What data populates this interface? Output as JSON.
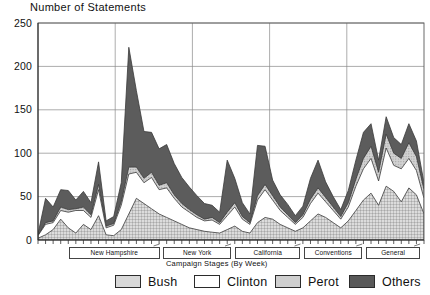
{
  "chart_data": {
    "type": "area",
    "stacked": true,
    "title": "Number of Statements",
    "xlabel": "Campaign Stages (By Week)",
    "ylabel": "",
    "ylim": [
      0,
      250
    ],
    "yticks": [
      0,
      50,
      100,
      150,
      200,
      250
    ],
    "ytick_labels": [
      "0",
      "50",
      "100",
      "150",
      "200",
      "250"
    ],
    "grid": true,
    "legend_position": "bottom",
    "x": [
      1,
      2,
      3,
      4,
      5,
      6,
      7,
      8,
      9,
      10,
      11,
      12,
      13,
      14,
      15,
      16,
      17,
      18,
      19,
      20,
      21,
      22,
      23,
      24,
      25,
      26,
      27,
      28,
      29,
      30,
      31,
      32,
      33,
      34,
      35,
      36,
      37,
      38,
      39,
      40,
      41,
      42,
      43,
      44,
      45,
      46,
      47,
      48,
      49,
      50,
      51,
      52
    ],
    "x_unit": "week",
    "series": [
      {
        "name": "Bush",
        "color": "#d8d8d8",
        "pattern": "crosshatch",
        "values": [
          2,
          6,
          12,
          24,
          14,
          8,
          18,
          12,
          28,
          6,
          5,
          12,
          30,
          48,
          42,
          36,
          30,
          26,
          22,
          18,
          14,
          12,
          10,
          9,
          8,
          12,
          16,
          10,
          8,
          20,
          26,
          24,
          18,
          14,
          10,
          14,
          22,
          30,
          26,
          20,
          14,
          22,
          34,
          46,
          54,
          40,
          62,
          56,
          44,
          60,
          52,
          30
        ]
      },
      {
        "name": "Clinton",
        "color": "#ffffff",
        "pattern": "solid-white",
        "values": [
          3,
          12,
          8,
          10,
          18,
          26,
          16,
          14,
          30,
          8,
          12,
          28,
          46,
          30,
          24,
          36,
          28,
          34,
          26,
          20,
          18,
          14,
          12,
          14,
          10,
          16,
          22,
          14,
          10,
          26,
          32,
          22,
          16,
          12,
          8,
          12,
          20,
          24,
          18,
          14,
          10,
          16,
          28,
          36,
          40,
          28,
          44,
          30,
          38,
          34,
          28,
          18
        ]
      },
      {
        "name": "Perot",
        "color": "#cfcfcf",
        "pattern": "dots",
        "values": [
          0,
          2,
          2,
          4,
          3,
          2,
          4,
          3,
          6,
          2,
          2,
          4,
          8,
          6,
          5,
          6,
          5,
          6,
          4,
          4,
          3,
          3,
          2,
          3,
          2,
          4,
          5,
          3,
          2,
          5,
          6,
          5,
          4,
          3,
          2,
          3,
          5,
          6,
          5,
          4,
          3,
          5,
          8,
          12,
          14,
          10,
          16,
          14,
          12,
          18,
          16,
          10
        ]
      },
      {
        "name": "Others",
        "color": "#595959",
        "pattern": "dark-solid",
        "values": [
          2,
          28,
          16,
          20,
          22,
          10,
          18,
          14,
          26,
          6,
          8,
          22,
          138,
          88,
          54,
          46,
          42,
          44,
          36,
          30,
          26,
          22,
          18,
          14,
          12,
          60,
          28,
          16,
          10,
          58,
          44,
          18,
          14,
          12,
          8,
          10,
          24,
          32,
          18,
          12,
          8,
          14,
          22,
          30,
          26,
          14,
          20,
          18,
          16,
          22,
          18,
          8
        ]
      }
    ],
    "stage_brackets": [
      {
        "label": "New Hampshire",
        "left_pct": 8.0,
        "right_pct": 31.5
      },
      {
        "label": "New York",
        "left_pct": 32.5,
        "right_pct": 50.0
      },
      {
        "label": "California",
        "left_pct": 51.0,
        "right_pct": 68.0
      },
      {
        "label": "Conventions",
        "left_pct": 69.0,
        "right_pct": 84.0
      },
      {
        "label": "General",
        "left_pct": 85.0,
        "right_pct": 99.0
      }
    ]
  },
  "legend": {
    "items": [
      {
        "label": "Bush",
        "swatch": "bush-swatch"
      },
      {
        "label": "Clinton",
        "swatch": "clinton-swatch"
      },
      {
        "label": "Perot",
        "swatch": "perot-swatch"
      },
      {
        "label": "Others",
        "swatch": "others-swatch"
      }
    ]
  }
}
